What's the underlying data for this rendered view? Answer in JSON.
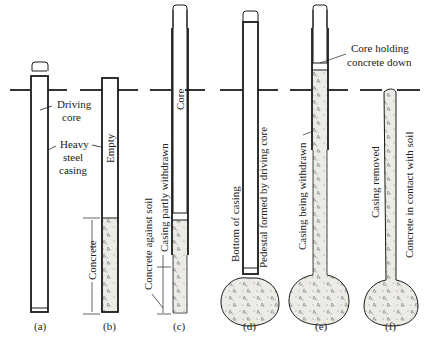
{
  "figure": {
    "panels": [
      {
        "id": "a",
        "caption": "(a)",
        "labels": [
          "Driving core",
          "Heavy steel casing"
        ]
      },
      {
        "id": "b",
        "caption": "(b)",
        "labels": [
          "Empty",
          "Concrete"
        ]
      },
      {
        "id": "c",
        "caption": "(c)",
        "labels": [
          "Core",
          "Casing partly withdrawn",
          "Concrete against soil"
        ]
      },
      {
        "id": "d",
        "caption": "(d)",
        "labels": [
          "Bottom of casing",
          "Pedestal formed by driving core"
        ]
      },
      {
        "id": "e",
        "caption": "(e)",
        "labels": [
          "Core holding concrete down",
          "Casing being withdrawn"
        ]
      },
      {
        "id": "f",
        "caption": "(f)",
        "labels": [
          "Casing removed",
          "Concrete in contact with soil"
        ]
      }
    ],
    "text": {
      "a_driving_1": "Driving",
      "a_driving_2": "core",
      "a_casing_1": "Heavy",
      "a_casing_2": "steel",
      "a_casing_3": "casing",
      "b_empty": "Empty",
      "b_concrete": "Concrete",
      "c_core": "Core",
      "c_withdrawn": "Casing partly withdrawn",
      "c_soil": "Concrete against soil",
      "d_bottom": "Bottom of casing",
      "d_pedestal": "Pedestal formed by driving core",
      "e_core_1": "Core holding",
      "e_core_2": "concrete down",
      "e_withdrawn": "Casing being withdrawn",
      "f_removed": "Casing removed",
      "f_contact": "Concrete in contact with soil"
    },
    "colors": {
      "line": "#1a1a1a",
      "concrete": "#e8e8e4",
      "soil": "#333333"
    }
  }
}
